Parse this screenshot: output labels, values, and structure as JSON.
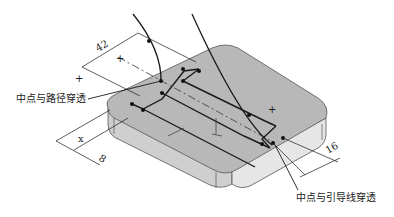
{
  "figure": {
    "type": "isometric sweep-path sketch",
    "colors": {
      "top_face": "#b8b8b8",
      "front_face": "#cfcfcf",
      "right_face": "#e6e6e6",
      "edge": "#555555",
      "line": "#1a1a1a"
    }
  },
  "annotations": {
    "left_callout": "中点与路径穿透",
    "right_callout": "中点与引导线穿透"
  },
  "dimensions": {
    "width_top": "42",
    "offset_left": "8",
    "offset_right": "16",
    "var_x": "x"
  },
  "markers": {
    "cross": "+"
  }
}
